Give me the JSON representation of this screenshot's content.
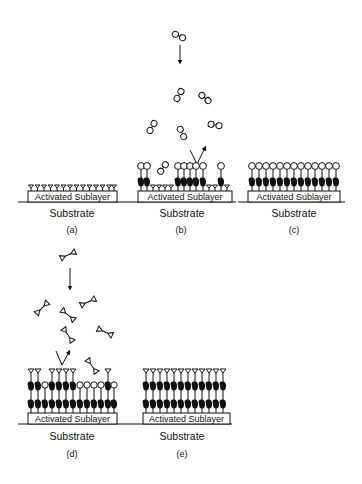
{
  "figure": {
    "sublayer_label": "Activated Sublayer",
    "substrate_label": "Substrate",
    "panels": [
      {
        "id": "a",
        "caption": "(a)",
        "state": "activated sublayer with terminal Y groups"
      },
      {
        "id": "b",
        "caption": "(b)",
        "state": "circle-terminated dimer molecules adsorbing"
      },
      {
        "id": "c",
        "caption": "(c)",
        "state": "complete circle-terminated monolayer"
      },
      {
        "id": "d",
        "caption": "(d)",
        "state": "triangle-terminated molecules adsorbing on second layer"
      },
      {
        "id": "e",
        "caption": "(e)",
        "state": "complete bilayer with triangle terminals"
      }
    ],
    "colors": {
      "ink": "#111111",
      "background": "#ffffff"
    }
  }
}
